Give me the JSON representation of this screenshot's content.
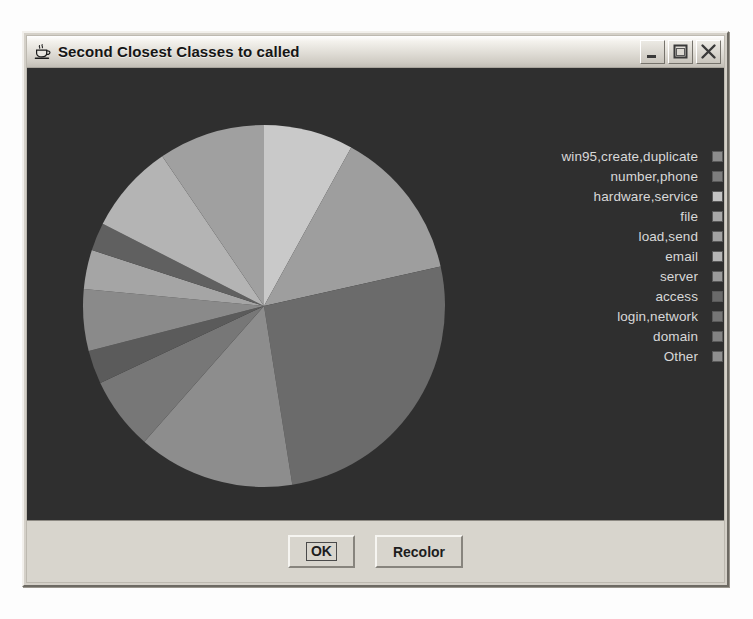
{
  "window": {
    "title": "Second Closest Classes to called",
    "app_icon": "java-coffee-cup-icon",
    "controls": {
      "minimize": "minimize-icon",
      "maximize": "maximize-icon",
      "close": "close-icon"
    }
  },
  "buttons": {
    "ok_label": "OK",
    "recolor_label": "Recolor"
  },
  "colors": {
    "chart_background": "#2f2f2f",
    "panel_background": "#d8d5cd",
    "titlebar_text": "#151515",
    "legend_text": "#d8d8d8"
  },
  "chart_data": {
    "type": "pie",
    "title": "Second Closest Classes to called",
    "xlabel": "",
    "ylabel": "",
    "legend_position": "right",
    "grid": false,
    "start_angle_deg": -90,
    "direction": "clockwise",
    "categories": [
      "win95,create,duplicate",
      "number,phone",
      "hardware,service",
      "file",
      "load,send",
      "email",
      "server",
      "access",
      "login,network",
      "domain",
      "Other"
    ],
    "values": [
      8.0,
      13.5,
      26.0,
      14.0,
      6.5,
      3.0,
      5.5,
      3.5,
      2.5,
      8.0,
      9.5
    ],
    "colors": [
      "#c9c9c9",
      "#9e9e9e",
      "#6b6b6b",
      "#8d8d8d",
      "#777777",
      "#5b5b5b",
      "#8a8a8a",
      "#a5a5a5",
      "#606060",
      "#b4b4b4",
      "#a0a0a0"
    ],
    "legend_swatch_colors": [
      "#8c8c8c",
      "#7e7e7e",
      "#c4c4c4",
      "#a9a9a9",
      "#a2a2a2",
      "#b6b6b6",
      "#9b9b9b",
      "#6a6a6a",
      "#767676",
      "#838383",
      "#8f8f8f"
    ]
  }
}
